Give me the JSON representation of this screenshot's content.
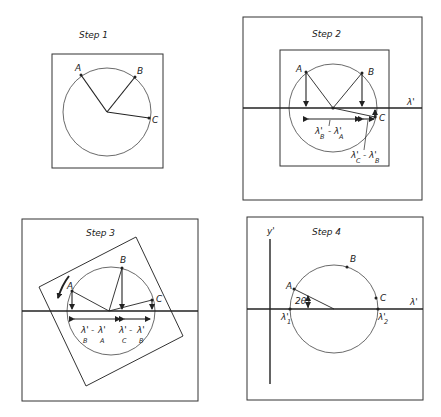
{
  "panels": [
    {
      "title": "Step 1",
      "points": [
        "A",
        "B",
        "C"
      ]
    },
    {
      "title": "Step 2",
      "points": [
        "A",
        "B",
        "C"
      ],
      "axis_label": "λ'",
      "annotations": {
        "ba_top": "λ'",
        "ba_minus": "-",
        "ba_top2": "λ'",
        "ba_sub1": "B",
        "ba_sub2": "A",
        "cb_top": "λ'",
        "cb_sub1": "C",
        "cb_minus": "-",
        "cb_top2": "λ'",
        "cb_sub2": "B"
      }
    },
    {
      "title": "Step 3",
      "points": [
        "A",
        "B",
        "C"
      ],
      "annotations": {
        "ba_top": "λ'",
        "ba_minus": "-",
        "ba_top2": "λ'",
        "ba_sub1": "B",
        "ba_sub2": "A",
        "cb_top": "λ'",
        "cb_minus": "-",
        "cb_top2": "λ'",
        "cb_sub1": "C",
        "cb_sub2": "B"
      }
    },
    {
      "title": "Step 4",
      "points": [
        "A",
        "B",
        "C"
      ],
      "x_axis_label": "λ'",
      "y_axis_label": "y'",
      "angle_label": "2θ",
      "lambda1": "λ'",
      "lambda1_sub": "1",
      "lambda2": "λ'",
      "lambda2_sub": "2"
    }
  ]
}
